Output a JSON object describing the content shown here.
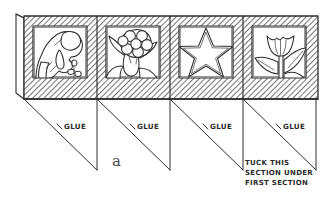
{
  "figure": {
    "label": "a",
    "type": "hand-drawn papercraft assembly diagram",
    "ink_color": "#2e2e2e",
    "background_color": "#ffffff"
  },
  "band": {
    "panel_count": 4,
    "border_style": "diagonal-hatched",
    "panels": [
      {
        "index": 1,
        "motif_name": "person-watering-flower-silhouette",
        "motif_label": "Child bending over flower"
      },
      {
        "index": 2,
        "motif_name": "blossom-cluster-silhouette",
        "motif_label": "Cluster blossom with leaves"
      },
      {
        "index": 3,
        "motif_name": "five-point-star-silhouette",
        "motif_label": "Five-pointed star"
      },
      {
        "index": 4,
        "motif_name": "tulip-silhouette",
        "motif_label": "Tulip with leaves"
      }
    ]
  },
  "tabs": [
    {
      "index": 1,
      "label": "GLUE"
    },
    {
      "index": 2,
      "label": "GLUE"
    },
    {
      "index": 3,
      "label": "GLUE"
    },
    {
      "index": 4,
      "label": "GLUE"
    }
  ],
  "instruction": {
    "lines": [
      "TUCK THIS",
      "SECTION UNDER",
      "FIRST SECTION"
    ]
  }
}
